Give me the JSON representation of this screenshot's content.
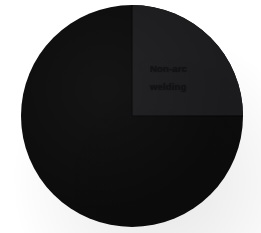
{
  "figure": {
    "background_color": "#ffffff",
    "width": 261,
    "height": 233
  },
  "labels": {
    "non_arc_line1": "Non-arc",
    "non_arc_line2": "welding"
  },
  "chart_data": {
    "type": "pie",
    "title": "",
    "subtitle": "",
    "xlabel": "",
    "ylabel": "",
    "grid": false,
    "legend_position": "none",
    "center": {
      "x": 132,
      "y": 116
    },
    "radius": 111,
    "start_angle_deg": 90,
    "direction": "clockwise",
    "categories": [
      "Non-arc welding",
      "Other welding"
    ],
    "values": [
      25,
      75
    ],
    "value_unit": "%",
    "colors": [
      "#1c1c1f",
      "#0c0c0d"
    ],
    "slices": [
      {
        "name": "Non-arc welding",
        "value": 25,
        "percent": 25,
        "color": "#1c1c1f",
        "start_angle_deg": 90,
        "end_angle_deg": 0,
        "label": "Non-arc welding",
        "label_shown": true
      },
      {
        "name": "Other welding",
        "value": 75,
        "percent": 75,
        "color": "#0c0c0d",
        "start_angle_deg": 0,
        "end_angle_deg": -270,
        "label": "",
        "label_shown": false
      }
    ],
    "annotations": [
      {
        "text": "Non-arc",
        "x": 150,
        "y": 60
      },
      {
        "text": "welding",
        "x": 150,
        "y": 78
      }
    ]
  }
}
